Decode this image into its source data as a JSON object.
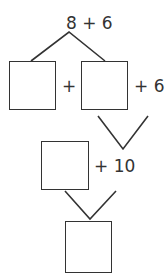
{
  "diagram": {
    "top_expression": "8 + 6",
    "row1": {
      "plus": "+",
      "addend": "+ 6"
    },
    "row2": {
      "addend": "+ 10"
    },
    "boxes": [
      "",
      "",
      "",
      ""
    ],
    "stroke_color": "#333333"
  }
}
